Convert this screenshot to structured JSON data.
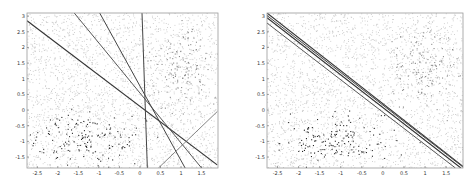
{
  "figure": {
    "panels": [
      "left",
      "right"
    ]
  },
  "chart_data": [
    {
      "type": "scatter",
      "title": "",
      "xlabel": "",
      "ylabel": "",
      "xlim": [
        -2.75,
        1.9
      ],
      "ylim": [
        -1.85,
        3.1
      ],
      "grid": false,
      "legend": null,
      "xticks": [
        -2.5,
        -2,
        -1.5,
        -1,
        -0.5,
        0,
        0.5,
        1,
        1.5
      ],
      "xtick_labels": [
        "-2.5",
        "-2",
        "-1.5",
        "-1",
        "-0.5",
        "0",
        "0.5",
        "1",
        "1.5"
      ],
      "yticks": [
        3,
        2.5,
        2,
        1.5,
        1,
        0.5,
        0,
        -0.5,
        -1,
        -1.5
      ],
      "ytick_labels": [
        "3",
        "2.5",
        "2",
        "1.5",
        "1",
        "0.5",
        "0",
        "-0.5",
        "-1",
        "-1.5"
      ],
      "series": [
        {
          "name": "background points (light)",
          "style": "light-gray dense uniform scatter",
          "region": {
            "x": [
              -2.75,
              1.9
            ],
            "y": [
              -1.85,
              3.1
            ]
          }
        },
        {
          "name": "cluster A (dark)",
          "style": "dark points",
          "center": [
            -1.3,
            -0.9
          ],
          "spread": [
            0.7,
            0.4
          ]
        },
        {
          "name": "cluster B (medium)",
          "style": "medium-gray points",
          "center": [
            1.0,
            1.4
          ],
          "spread": [
            0.35,
            0.6
          ]
        }
      ],
      "lines": [
        {
          "name": "line-1",
          "x": [
            -2.75,
            1.88
          ],
          "y": [
            2.85,
            -1.75
          ],
          "color": "#333333",
          "width": 1.2
        },
        {
          "name": "line-2",
          "x": [
            -1.6,
            1.5
          ],
          "y": [
            3.1,
            -1.85
          ],
          "color": "#555555",
          "width": 1.0
        },
        {
          "name": "line-3",
          "x": [
            -0.98,
            1.1
          ],
          "y": [
            3.1,
            -1.85
          ],
          "color": "#444444",
          "width": 1.0
        },
        {
          "name": "line-4",
          "x": [
            0.05,
            0.18
          ],
          "y": [
            3.1,
            -1.85
          ],
          "color": "#444444",
          "width": 1.0
        },
        {
          "name": "line-5",
          "x": [
            0.45,
            1.88
          ],
          "y": [
            -1.85,
            -0.05
          ],
          "color": "#777777",
          "width": 0.9
        }
      ]
    },
    {
      "type": "scatter",
      "title": "",
      "xlabel": "",
      "ylabel": "",
      "xlim": [
        -2.75,
        1.9
      ],
      "ylim": [
        -1.85,
        3.1
      ],
      "grid": false,
      "legend": null,
      "xticks": [
        -2.5,
        -2,
        -1.5,
        -1,
        -0.5,
        0,
        0.5,
        1,
        1.5
      ],
      "xtick_labels": [
        "-2.5",
        "-2",
        "-1.5",
        "-1",
        "-0.5",
        "0",
        "0.5",
        "1",
        "1.5"
      ],
      "yticks": [
        3,
        2.5,
        2,
        1.5,
        1,
        0.5,
        0,
        -0.5,
        -1,
        -1.5
      ],
      "ytick_labels": [
        "3",
        "2.5",
        "2",
        "1.5",
        "1",
        "0.5",
        "0",
        "-0.5",
        "-1",
        "-1.5"
      ],
      "series": [
        {
          "name": "background points (light)",
          "style": "light-gray dense uniform scatter",
          "region": {
            "x": [
              -2.75,
              1.9
            ],
            "y": [
              -1.85,
              3.1
            ]
          }
        },
        {
          "name": "cluster A (dark)",
          "style": "dark points",
          "center": [
            -1.3,
            -0.9
          ],
          "spread": [
            0.7,
            0.4
          ]
        },
        {
          "name": "cluster B (medium)",
          "style": "medium-gray points",
          "center": [
            1.0,
            1.4
          ],
          "spread": [
            0.35,
            0.6
          ]
        }
      ],
      "lines": [
        {
          "name": "line-1",
          "x": [
            -2.75,
            1.9
          ],
          "y": [
            3.1,
            -1.8
          ],
          "color": "#333333",
          "width": 1.1
        },
        {
          "name": "line-2",
          "x": [
            -2.75,
            1.9
          ],
          "y": [
            3.02,
            -1.82
          ],
          "color": "#444444",
          "width": 1.0
        },
        {
          "name": "line-3",
          "x": [
            -2.75,
            1.85
          ],
          "y": [
            2.95,
            -1.85
          ],
          "color": "#333333",
          "width": 1.1
        },
        {
          "name": "line-4",
          "x": [
            -2.75,
            1.72
          ],
          "y": [
            2.78,
            -1.85
          ],
          "color": "#555555",
          "width": 1.0
        }
      ]
    }
  ],
  "render": {
    "frame_color": "#999999",
    "plot_bg": "#ffffff",
    "light_point_color": "#c8c8c8",
    "medium_point_color": "#8a8a8a",
    "dark_point_color": "#2a2a2a",
    "panel_boxes": [
      {
        "x0": 27,
        "y0": 13,
        "x1": 218,
        "y1": 168
      },
      {
        "x0": 27,
        "y0": 13,
        "x1": 223,
        "y1": 168
      }
    ]
  }
}
